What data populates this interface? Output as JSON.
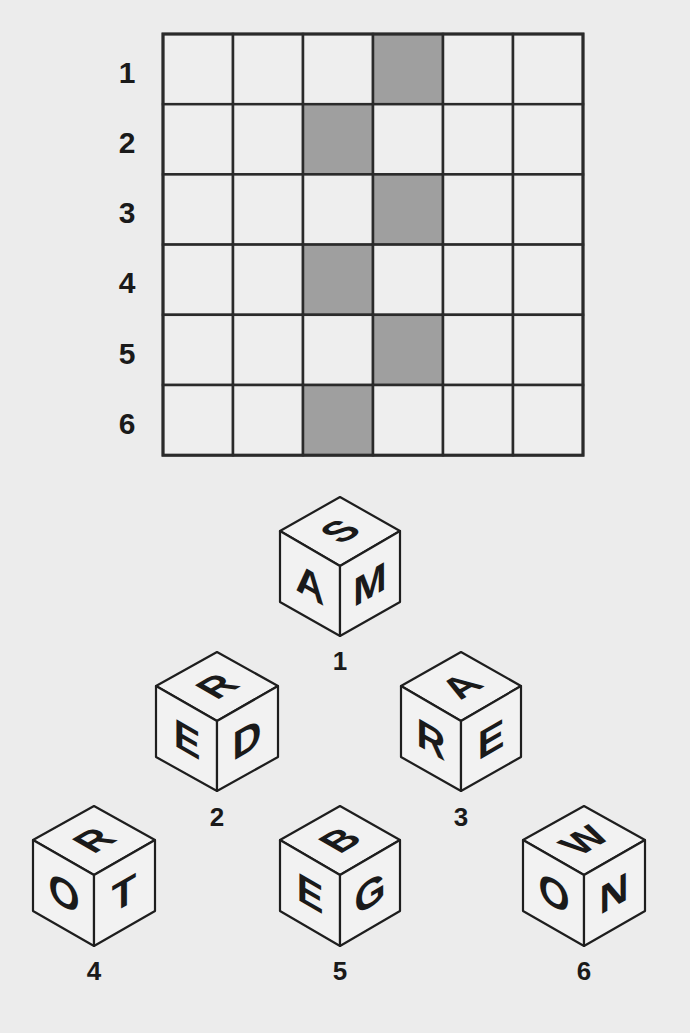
{
  "colors": {
    "background": "#ececec",
    "cell_empty": "#eeeeee",
    "cell_shaded": "#9f9f9f",
    "grid_line": "#2a2a2a",
    "text": "#1a1a1a"
  },
  "grid": {
    "rows": 6,
    "cols": 6,
    "row_labels": [
      "1",
      "2",
      "3",
      "4",
      "5",
      "6"
    ],
    "shaded_cells": [
      {
        "row": 1,
        "col": 4
      },
      {
        "row": 2,
        "col": 3
      },
      {
        "row": 3,
        "col": 4
      },
      {
        "row": 4,
        "col": 3
      },
      {
        "row": 5,
        "col": 4
      },
      {
        "row": 6,
        "col": 3
      }
    ]
  },
  "cubes": [
    {
      "label": "1",
      "top": "S",
      "left": "A",
      "right": "M"
    },
    {
      "label": "2",
      "top": "R",
      "left": "E",
      "right": "D"
    },
    {
      "label": "3",
      "top": "A",
      "left": "R",
      "right": "E"
    },
    {
      "label": "4",
      "top": "R",
      "left": "O",
      "right": "T"
    },
    {
      "label": "5",
      "top": "B",
      "left": "E",
      "right": "G"
    },
    {
      "label": "6",
      "top": "W",
      "left": "O",
      "right": "N"
    }
  ]
}
